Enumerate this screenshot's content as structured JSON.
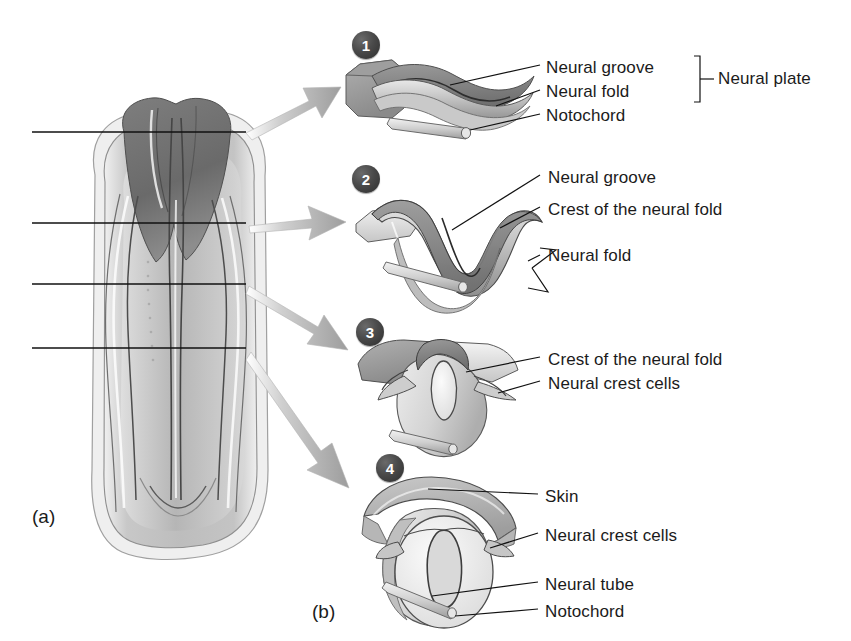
{
  "figure": {
    "part_a_label": "(a)",
    "part_b_label": "(b)"
  },
  "embryo": {
    "name": "dorsal-view-embryo",
    "section_lines": [
      {
        "id": "section-1",
        "y": 132
      },
      {
        "id": "section-2",
        "y": 223
      },
      {
        "id": "section-3",
        "y": 284
      },
      {
        "id": "section-4",
        "y": 348
      }
    ]
  },
  "panels": [
    {
      "number": "1",
      "badge_x": 352,
      "badge_y": 31,
      "bracket_label": "Neural plate",
      "labels": [
        {
          "text": "Neural groove",
          "x": 546,
          "y": 58
        },
        {
          "text": "Neural fold",
          "x": 546,
          "y": 82
        },
        {
          "text": "Notochord",
          "x": 546,
          "y": 106
        }
      ]
    },
    {
      "number": "2",
      "badge_x": 352,
      "badge_y": 165,
      "labels": [
        {
          "text": "Neural groove",
          "x": 548,
          "y": 168
        },
        {
          "text": "Crest of the neural fold",
          "x": 548,
          "y": 200
        },
        {
          "text": "Neural fold",
          "x": 548,
          "y": 246
        }
      ]
    },
    {
      "number": "3",
      "badge_x": 356,
      "badge_y": 318,
      "labels": [
        {
          "text": "Crest of the neural fold",
          "x": 548,
          "y": 350
        },
        {
          "text": "Neural crest cells",
          "x": 548,
          "y": 374
        }
      ]
    },
    {
      "number": "4",
      "badge_x": 376,
      "badge_y": 454,
      "labels": [
        {
          "text": "Skin",
          "x": 545,
          "y": 487
        },
        {
          "text": "Neural crest cells",
          "x": 545,
          "y": 526
        },
        {
          "text": "Neural tube",
          "x": 545,
          "y": 575
        },
        {
          "text": "Notochord",
          "x": 545,
          "y": 602
        }
      ]
    }
  ],
  "colors": {
    "line": "#111111",
    "badge_fill": "#3d3d3d",
    "badge_text": "#ffffff",
    "arrow_gray": "#b9b9b9",
    "tissue_light": "#d6d6d6",
    "tissue_mid": "#a8a8a8",
    "tissue_dark": "#6e6e6e",
    "background": "#ffffff"
  }
}
